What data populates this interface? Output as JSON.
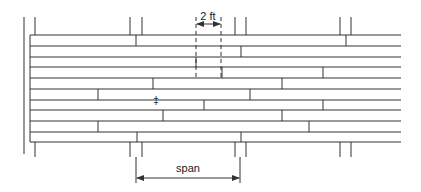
{
  "diagram": {
    "colors": {
      "line": "#333333",
      "background": "#ffffff"
    },
    "wall": {
      "x": 24,
      "y1": 17,
      "y2": 154
    },
    "boards": {
      "x_start": 30,
      "x_end": 401,
      "edges_y": [
        35,
        46,
        57,
        67,
        78,
        89,
        100,
        110,
        121,
        132,
        142
      ],
      "rows": [
        {
          "joints_x": [
            136,
            346
          ]
        },
        {
          "joints_x": [
            241
          ]
        },
        {
          "joints_x": [
            196
          ]
        },
        {
          "joints_x": [
            222,
            323
          ]
        },
        {
          "joints_x": [
            153,
            282
          ]
        },
        {
          "joints_x": [
            98,
            250
          ]
        },
        {
          "joints_x": [
            204,
            323
          ]
        },
        {
          "joints_x": [
            163,
            282
          ]
        },
        {
          "joints_x": [
            98,
            309
          ]
        },
        {
          "joints_x": [
            137,
            241
          ]
        }
      ]
    },
    "supports": {
      "top_y1": 17,
      "bottom_y2": 157,
      "posts_x": [
        35,
        130,
        142,
        235,
        246,
        340,
        351
      ]
    },
    "nail_mark": {
      "x": 156,
      "y": 100,
      "glyph": "‡"
    },
    "dimension_2ft": {
      "label": "2 ft",
      "x1": 196,
      "x2": 221,
      "arrow_y": 24,
      "label_x": 208,
      "label_y": 20,
      "dashed_top": 17,
      "dashed_bottom": 78
    },
    "dimension_span": {
      "label": "span",
      "x1": 136,
      "x2": 240,
      "arrow_y": 178,
      "label_x": 188,
      "label_y": 172,
      "ext_top": 157,
      "ext_bottom": 183
    }
  }
}
